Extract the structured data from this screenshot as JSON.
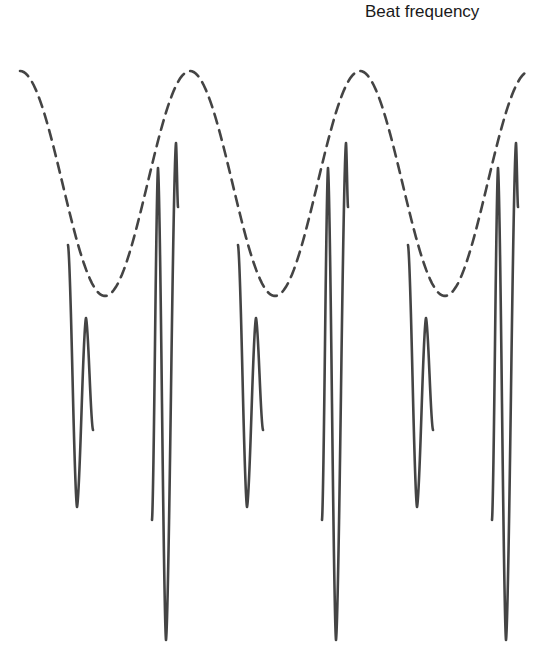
{
  "title": "Beat frequency",
  "diagram": {
    "envelope_label": "envelope",
    "waveform_label": "waveform",
    "beat_periods_shown": 3,
    "envelope_style": "dashed",
    "waveform_style": "solid",
    "colors": {
      "line": "#444444",
      "text": "#1a1a1a",
      "background": "#ffffff"
    }
  }
}
